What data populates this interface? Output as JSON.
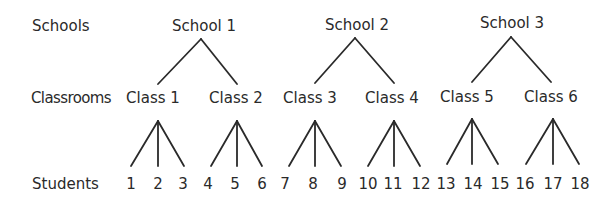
{
  "rows": {
    "schools": "Schools",
    "classrooms": "Classrooms",
    "students": "Students"
  },
  "schools": [
    "School 1",
    "School 2",
    "School 3"
  ],
  "classes": [
    "Class 1",
    "Class 2",
    "Class 3",
    "Class 4",
    "Class 5",
    "Class 6"
  ],
  "students": [
    "1",
    "2",
    "3",
    "4",
    "5",
    "6",
    "7",
    "8",
    "9",
    "10",
    "11",
    "12",
    "13",
    "14",
    "15",
    "16",
    "17",
    "18"
  ]
}
